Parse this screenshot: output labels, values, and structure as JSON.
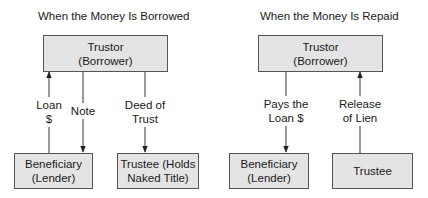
{
  "panels": [
    {
      "title": "When the Money Is Borrowed",
      "top_box": {
        "line1": "Trustor",
        "line2": "(Borrower)"
      },
      "bottom_left_box": {
        "line1": "Beneficiary",
        "line2": "(Lender)"
      },
      "bottom_right_box": {
        "line1": "Trustee (Holds",
        "line2": "Naked Title)"
      },
      "connectors": [
        {
          "label_line1": "Loan",
          "label_line2": "$",
          "direction": "up",
          "from": "Beneficiary (Lender)",
          "to": "Trustor (Borrower)"
        },
        {
          "label_line1": "Note",
          "label_line2": "",
          "direction": "down",
          "from": "Trustor (Borrower)",
          "to": "Beneficiary (Lender)"
        },
        {
          "label_line1": "Deed of",
          "label_line2": "Trust",
          "direction": "down",
          "from": "Trustor (Borrower)",
          "to": "Trustee (Holds Naked Title)"
        }
      ]
    },
    {
      "title": "When the Money Is Repaid",
      "top_box": {
        "line1": "Trustor",
        "line2": "(Borrower)"
      },
      "bottom_left_box": {
        "line1": "Beneficiary",
        "line2": "(Lender)"
      },
      "bottom_right_box": {
        "line1": "Trustee",
        "line2": ""
      },
      "connectors": [
        {
          "label_line1": "Pays the",
          "label_line2": "Loan $",
          "direction": "down",
          "from": "Trustor (Borrower)",
          "to": "Beneficiary (Lender)"
        },
        {
          "label_line1": "Release",
          "label_line2": "of Lien",
          "direction": "up",
          "from": "Trustee",
          "to": "Trustor (Borrower)"
        }
      ]
    }
  ],
  "colors": {
    "box_fill": "#e4e4e4",
    "box_border": "#555555",
    "line": "#333333",
    "text": "#1a1a1a"
  }
}
